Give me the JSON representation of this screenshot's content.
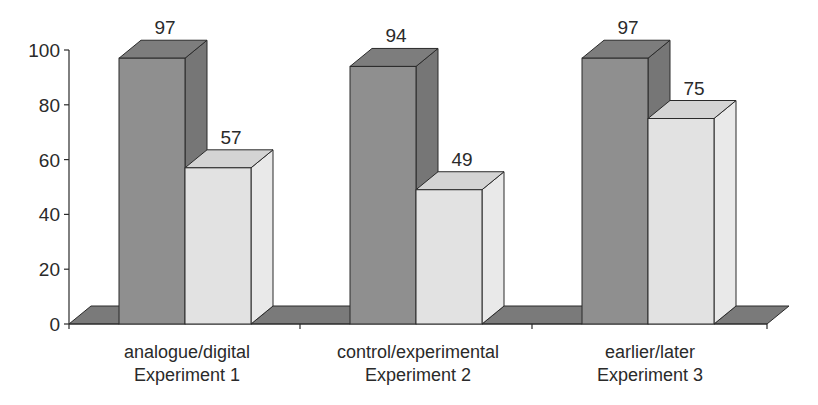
{
  "chart_data": {
    "type": "bar",
    "subtype": "3d-clustered-column",
    "title": "",
    "xlabel": "",
    "ylabel": "",
    "ylim": [
      0,
      100
    ],
    "yticks": [
      0,
      20,
      40,
      60,
      80,
      100
    ],
    "grid": false,
    "legend": null,
    "categories": [
      {
        "line1": "analogue/digital",
        "line2": "Experiment 1"
      },
      {
        "line1": "control/experimental",
        "line2": "Experiment 2"
      },
      {
        "line1": "earlier/later",
        "line2": "Experiment 3"
      }
    ],
    "series": [
      {
        "name": "first condition",
        "color": "#8c8c8c",
        "values": [
          97,
          94,
          97
        ]
      },
      {
        "name": "second condition",
        "color": "#dedede",
        "values": [
          57,
          49,
          75
        ]
      }
    ],
    "data_labels": true
  },
  "colors": {
    "dark_front": "#8f8f8f",
    "dark_top": "#7d7d7d",
    "dark_side": "#767676",
    "light_front": "#e2e2e2",
    "light_top": "#d4d4d4",
    "light_side": "#e9e9e9",
    "floor": "#7a7a7a",
    "stroke": "#2a2a2a"
  }
}
